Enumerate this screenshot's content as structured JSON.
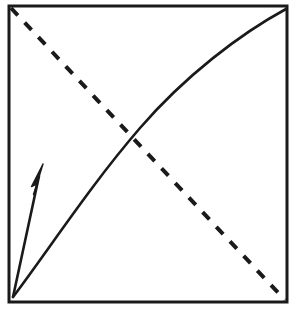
{
  "figure": {
    "title": "",
    "background_color": "#ffffff",
    "ink_color": "#1a1a1a",
    "width": 299,
    "height": 310,
    "frame": {
      "name": "plot-frame",
      "x": 9,
      "y": 6,
      "width": 278,
      "height": 296,
      "stroke_width": 3,
      "stroke_color": "#1a1a1a",
      "fill": "none"
    },
    "solid_curve": {
      "name": "concave-increasing-curve",
      "style": "solid",
      "stroke_width": 2.6,
      "stroke_color": "#1a1a1a",
      "description": "Concave increasing curve from bottom-left corner to top-right corner",
      "path": "M 13 297 C 52 245, 90 186, 140 128 C 185 76, 240 34, 286 9"
    },
    "dashed_line": {
      "name": "dashed-diagonal-line",
      "style": "dashed",
      "stroke_width": 4,
      "stroke_color": "#1a1a1a",
      "dash_length": 10,
      "gap_length": 10,
      "description": "Straight dashed diagonal from top-left corner to bottom-right corner",
      "path": "M 11 8 L 285 300"
    },
    "arrow": {
      "name": "upward-arrow",
      "style": "solid-filled-head",
      "stroke_width": 2.6,
      "stroke_color": "#1a1a1a",
      "fill_color": "#1a1a1a",
      "description": "Arrow from bottom-left origin pointing up and slightly right, tip short of the curve",
      "shaft_path": "M 13 297 L 39 176",
      "head_path": "M 43 164 L 32 186 L 38 184 L 34 194 Z"
    },
    "intersection": {
      "name": "curve-dash-intersection",
      "x": 118,
      "y": 126,
      "visible_marker": false
    }
  }
}
